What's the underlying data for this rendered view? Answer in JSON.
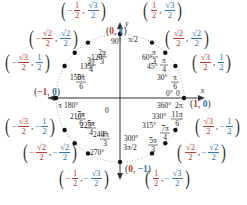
{
  "diagram": {
    "type": "unit-circle",
    "axes": {
      "x_label": "x",
      "y_label": "y",
      "origin_label": "0"
    },
    "colors": {
      "cos": "#c0392b",
      "sin": "#2e75b6",
      "axis": "#333333",
      "circle": "#999999"
    },
    "axis_points": [
      {
        "id": "p0",
        "label": "(1, 0)",
        "x": "1",
        "y": "0",
        "degrees": "0°",
        "radians": "0",
        "alt_degrees": "360°",
        "alt_radians": "2π"
      },
      {
        "id": "p90",
        "label": "(0, 1)",
        "x": "0",
        "y": "1",
        "degrees": "90°",
        "radians": "π/2"
      },
      {
        "id": "p180",
        "label": "(−1, 0)",
        "x": "−1",
        "y": "0",
        "degrees": "180°",
        "radians": "π"
      },
      {
        "id": "p270",
        "label": "(0, −1)",
        "x": "0",
        "y": "−1",
        "degrees": "270°",
        "radians": "3π/2"
      }
    ],
    "points": [
      {
        "degrees": "30°",
        "rad_num": "π",
        "rad_den": "6",
        "x": {
          "sign": "",
          "num": "√3",
          "den": "2"
        },
        "y": {
          "sign": "",
          "num": "1",
          "den": "2"
        }
      },
      {
        "degrees": "45°",
        "rad_num": "π",
        "rad_den": "4",
        "x": {
          "sign": "",
          "num": "√2",
          "den": "2"
        },
        "y": {
          "sign": "",
          "num": "√2",
          "den": "2"
        }
      },
      {
        "degrees": "60°",
        "rad_num": "π",
        "rad_den": "3",
        "x": {
          "sign": "",
          "num": "1",
          "den": "2"
        },
        "y": {
          "sign": "",
          "num": "√3",
          "den": "2"
        }
      },
      {
        "degrees": "120°",
        "rad_num": "2π",
        "rad_den": "3",
        "x": {
          "sign": "−",
          "num": "1",
          "den": "2"
        },
        "y": {
          "sign": "",
          "num": "√3",
          "den": "2"
        }
      },
      {
        "degrees": "135°",
        "rad_num": "3π",
        "rad_den": "4",
        "x": {
          "sign": "−",
          "num": "√2",
          "den": "2"
        },
        "y": {
          "sign": "",
          "num": "√2",
          "den": "2"
        }
      },
      {
        "degrees": "150°",
        "rad_num": "5π",
        "rad_den": "6",
        "x": {
          "sign": "−",
          "num": "√3",
          "den": "2"
        },
        "y": {
          "sign": "",
          "num": "1",
          "den": "2"
        }
      },
      {
        "degrees": "210°",
        "rad_num": "7π",
        "rad_den": "6",
        "x": {
          "sign": "−",
          "num": "√3",
          "den": "2"
        },
        "y": {
          "sign": "−",
          "num": "1",
          "den": "2"
        }
      },
      {
        "degrees": "225°",
        "rad_num": "5π",
        "rad_den": "4",
        "x": {
          "sign": "−",
          "num": "√2",
          "den": "2"
        },
        "y": {
          "sign": "−",
          "num": "√2",
          "den": "2"
        }
      },
      {
        "degrees": "240°",
        "rad_num": "4π",
        "rad_den": "3",
        "x": {
          "sign": "−",
          "num": "1",
          "den": "2"
        },
        "y": {
          "sign": "−",
          "num": "√3",
          "den": "2"
        }
      },
      {
        "degrees": "300°",
        "rad_num": "5π",
        "rad_den": "3",
        "x": {
          "sign": "",
          "num": "1",
          "den": "2"
        },
        "y": {
          "sign": "−",
          "num": "√3",
          "den": "2"
        }
      },
      {
        "degrees": "315°",
        "rad_num": "7π",
        "rad_den": "4",
        "x": {
          "sign": "",
          "num": "√2",
          "den": "2"
        },
        "y": {
          "sign": "−",
          "num": "√2",
          "den": "2"
        }
      },
      {
        "degrees": "330°",
        "rad_num": "11π",
        "rad_den": "6",
        "x": {
          "sign": "",
          "num": "√3",
          "den": "2"
        },
        "y": {
          "sign": "−",
          "num": "1",
          "den": "2"
        }
      }
    ]
  }
}
